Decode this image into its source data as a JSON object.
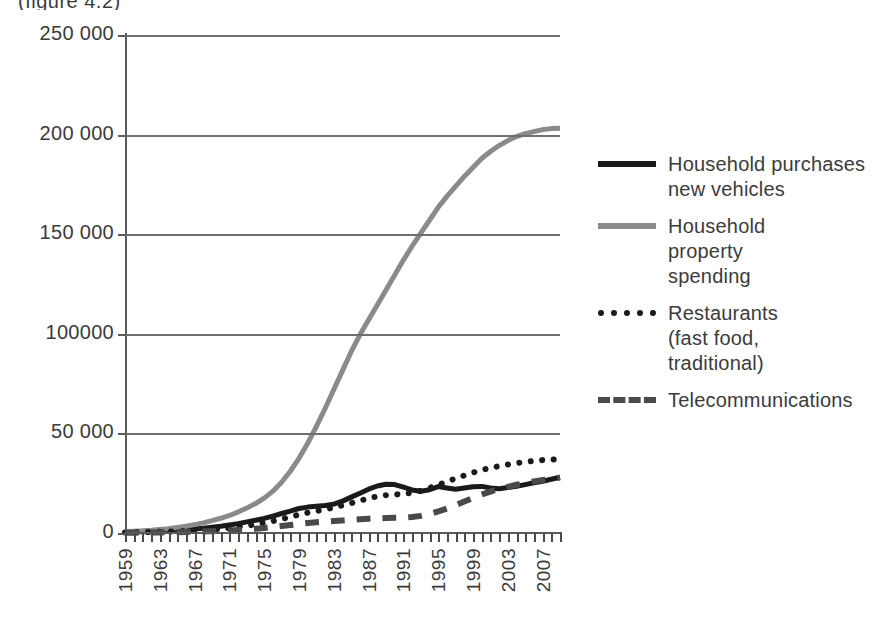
{
  "caption_fragment": "(figure 4.2)",
  "chart_data": {
    "type": "line",
    "title": "",
    "subtitle": "",
    "xlabel": "",
    "ylabel": "",
    "grid": true,
    "legend_position": "right",
    "ylim": [
      0,
      250000
    ],
    "y_ticks": [
      0,
      50000,
      100000,
      150000,
      200000,
      250000
    ],
    "y_tick_labels": [
      "0",
      "50 000",
      "100000",
      "150 000",
      "200 000",
      "250 000"
    ],
    "xlim": [
      1959,
      2009
    ],
    "x_tick_labels": [
      "1959",
      "1963",
      "1967",
      "1971",
      "1975",
      "1979",
      "1983",
      "1987",
      "1991",
      "1995",
      "1999",
      "2003",
      "2007"
    ],
    "x_tick_years": [
      1959,
      1963,
      1967,
      1971,
      1975,
      1979,
      1983,
      1987,
      1991,
      1995,
      1999,
      2003,
      2007
    ],
    "x": [
      1959,
      1960,
      1961,
      1962,
      1963,
      1964,
      1965,
      1966,
      1967,
      1968,
      1969,
      1970,
      1971,
      1972,
      1973,
      1974,
      1975,
      1976,
      1977,
      1978,
      1979,
      1980,
      1981,
      1982,
      1983,
      1984,
      1985,
      1986,
      1987,
      1988,
      1989,
      1990,
      1991,
      1992,
      1993,
      1994,
      1995,
      1996,
      1997,
      1998,
      1999,
      2000,
      2001,
      2002,
      2003,
      2004,
      2005,
      2006,
      2007,
      2008,
      2009
    ],
    "series": [
      {
        "name": "Household purchases new vehicles",
        "style": "solid",
        "color": "#1a1a1a",
        "width": 5,
        "values": [
          400,
          500,
          600,
          700,
          900,
          1100,
          1400,
          1700,
          2000,
          2400,
          2900,
          3400,
          4000,
          4700,
          5600,
          6400,
          7300,
          8500,
          9800,
          11000,
          12300,
          13000,
          13400,
          13800,
          14500,
          16000,
          18000,
          20000,
          22000,
          23600,
          24500,
          24300,
          23000,
          21600,
          21000,
          21700,
          23300,
          22600,
          22000,
          22600,
          23200,
          23400,
          22600,
          22200,
          22800,
          23500,
          24300,
          25200,
          26000,
          27000,
          28000
        ]
      },
      {
        "name": "Household property spending",
        "style": "solid",
        "color": "#8a8a8a",
        "width": 5,
        "values": [
          700,
          900,
          1100,
          1400,
          1800,
          2200,
          2800,
          3400,
          4200,
          5100,
          6200,
          7400,
          8800,
          10500,
          12500,
          14800,
          17500,
          21000,
          25500,
          31000,
          37500,
          45000,
          53500,
          62500,
          72000,
          81500,
          91000,
          99500,
          107000,
          114500,
          122000,
          129500,
          137000,
          144000,
          150500,
          157000,
          163500,
          169000,
          174000,
          179000,
          183500,
          188000,
          191500,
          194500,
          197000,
          199000,
          200500,
          201500,
          202500,
          203000,
          203200
        ]
      },
      {
        "name": "Restaurants (fast food, traditional)",
        "style": "dotted",
        "color": "#1a1a1a",
        "width": 6,
        "values": [
          300,
          350,
          400,
          500,
          600,
          700,
          850,
          1000,
          1200,
          1450,
          1750,
          2100,
          2500,
          3000,
          3600,
          4300,
          5100,
          6000,
          7000,
          8100,
          9200,
          10200,
          11000,
          11800,
          12800,
          13900,
          15000,
          16200,
          17400,
          18400,
          19000,
          19300,
          19600,
          20200,
          21200,
          22600,
          24200,
          25800,
          27400,
          28900,
          30300,
          31600,
          32700,
          33600,
          34400,
          35100,
          35700,
          36200,
          36600,
          36900,
          37000
        ]
      },
      {
        "name": "Telecommunications",
        "style": "dashed",
        "color": "#4a4a4a",
        "width": 6,
        "values": [
          150,
          180,
          210,
          250,
          300,
          360,
          430,
          520,
          620,
          740,
          880,
          1050,
          1250,
          1500,
          1800,
          2150,
          2550,
          3000,
          3500,
          4000,
          4500,
          5000,
          5400,
          5700,
          6000,
          6300,
          6600,
          6900,
          7200,
          7400,
          7500,
          7600,
          7700,
          8000,
          8600,
          9500,
          10800,
          12300,
          14000,
          15800,
          17600,
          19300,
          20800,
          22100,
          23200,
          24200,
          25100,
          25900,
          26600,
          27200,
          27800
        ]
      }
    ]
  },
  "legend": {
    "items": [
      {
        "label": "Household purchases\nnew vehicles",
        "marker": "solid-black-thick"
      },
      {
        "label": "Household\nproperty\nspending",
        "marker": "solid-gray"
      },
      {
        "label": "Restaurants\n(fast food,\ntraditional)",
        "marker": "dotted-black"
      },
      {
        "label": "Telecommunications",
        "marker": "dashed-black"
      }
    ]
  }
}
